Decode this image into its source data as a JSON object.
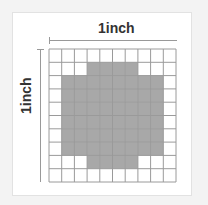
{
  "diagram": {
    "horizontal_label": "1inch",
    "vertical_label": "1inch",
    "grid": {
      "rows": 10,
      "cols": 10
    },
    "shaded_cells": [
      [],
      [
        3,
        4,
        5,
        6
      ],
      [
        1,
        2,
        3,
        4,
        5,
        6,
        7,
        8
      ],
      [
        1,
        2,
        3,
        4,
        5,
        6,
        7,
        8
      ],
      [
        1,
        2,
        3,
        4,
        5,
        6,
        7,
        8
      ],
      [
        1,
        2,
        3,
        4,
        5,
        6,
        7,
        8
      ],
      [
        1,
        2,
        3,
        4,
        5,
        6,
        7,
        8
      ],
      [
        1,
        2,
        3,
        4,
        5,
        6,
        7,
        8
      ],
      [
        3,
        4,
        5,
        6
      ],
      []
    ],
    "colors": {
      "shade": "#a8a8a8",
      "grid": "#9a9a9a",
      "background": "#ffffff"
    }
  }
}
